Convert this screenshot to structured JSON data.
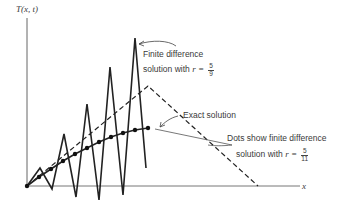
{
  "axes": {
    "y_label": "T(x, t)",
    "x_label": "x"
  },
  "annotations": {
    "finite_diff_unstable": {
      "line1": "Finite difference",
      "line2": "solution with",
      "r_var": "r =",
      "r_num": "5",
      "r_den": "9"
    },
    "exact": {
      "text": "Exact solution"
    },
    "finite_diff_stable": {
      "line1": "Dots show finite difference",
      "line2": "solution with",
      "r_var": "r =",
      "r_num": "5",
      "r_den": "11"
    }
  },
  "chart_data": {
    "type": "line",
    "title": "",
    "xlabel": "x",
    "ylabel": "T(x, t)",
    "grid": false,
    "series": [
      {
        "name": "Exact solution",
        "style": "dashed",
        "points_px": [
          [
            27,
            186
          ],
          [
            148,
            86
          ],
          [
            258,
            186
          ]
        ]
      },
      {
        "name": "Finite difference solution with r = 5/9",
        "style": "solid-oscillating",
        "points_px": [
          [
            27,
            186
          ],
          [
            40,
            168
          ],
          [
            52,
            189
          ],
          [
            64,
            134
          ],
          [
            76,
            197
          ],
          [
            87,
            104
          ],
          [
            99,
            200
          ],
          [
            110,
            67
          ],
          [
            123,
            195
          ],
          [
            135,
            38
          ],
          [
            146,
            168
          ]
        ]
      },
      {
        "name": "Dots show finite difference solution with r = 5/11",
        "style": "solid-with-dots",
        "points_px": [
          [
            27,
            186
          ],
          [
            39,
            177
          ],
          [
            51,
            169
          ],
          [
            63,
            161
          ],
          [
            75,
            154
          ],
          [
            87,
            148
          ],
          [
            99,
            142
          ],
          [
            111,
            137
          ],
          [
            123,
            133
          ],
          [
            135,
            130
          ],
          [
            148,
            128
          ]
        ]
      }
    ]
  }
}
